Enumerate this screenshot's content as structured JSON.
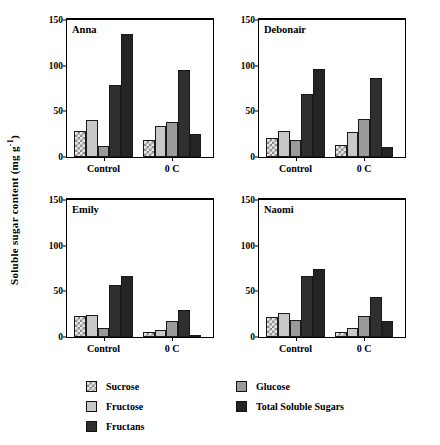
{
  "figure": {
    "ylabel_text": "Soluble sugar content  (mg g",
    "ylabel_sup": "-1",
    "ylabel_tail": ")",
    "ylabel_full": "Soluble sugar content (mg g-1)"
  },
  "legend": {
    "columns": [
      {
        "items": [
          {
            "label": "Sucrose",
            "key": "sucrose",
            "swatch": "checkered-swatch",
            "color": "#e8e8e8"
          },
          {
            "label": "Fructose",
            "key": "fructose",
            "swatch": "light-gray-swatch",
            "color": "#c8c8c8"
          },
          {
            "label": "Fructans",
            "key": "fructans",
            "swatch": "dark-swatch",
            "color": "#2f2f2f"
          }
        ]
      },
      {
        "items": [
          {
            "label": "Glucose",
            "key": "glucose",
            "swatch": "medium-gray-swatch",
            "color": "#9a9a9a"
          },
          {
            "label": "Total Soluble Sugars",
            "key": "total",
            "swatch": "darkest-swatch",
            "color": "#242424"
          }
        ]
      }
    ]
  },
  "chart_data": {
    "type": "bar",
    "title": "",
    "xlabel": "",
    "ylabel": "Soluble sugar content (mg g-1)",
    "ylim": [
      0,
      150
    ],
    "yticks": [
      0,
      50,
      100,
      150
    ],
    "grid": false,
    "legend_position": "bottom",
    "categories": [
      "Control",
      "0 C"
    ],
    "series_names": [
      "Sucrose",
      "Fructose",
      "Glucose",
      "Fructans",
      "Total Soluble Sugars"
    ],
    "panels": [
      {
        "name": "Anna",
        "groups": [
          {
            "category": "Control",
            "values": [
              28,
              40,
              12,
              79,
              135
            ]
          },
          {
            "category": "0 C",
            "values": [
              19,
              34,
              38,
              95,
              25
            ]
          }
        ]
      },
      {
        "name": "Debonair",
        "groups": [
          {
            "category": "Control",
            "values": [
              21,
              28,
              19,
              69,
              96
            ]
          },
          {
            "category": "0 C",
            "values": [
              13,
              27,
              42,
              87,
              11
            ]
          }
        ]
      },
      {
        "name": "Emily",
        "groups": [
          {
            "category": "Control",
            "values": [
              23,
              24,
              10,
              57,
              67
            ]
          },
          {
            "category": "0 C",
            "values": [
              6,
              8,
              18,
              30,
              2
            ]
          }
        ]
      },
      {
        "name": "Naomi",
        "groups": [
          {
            "category": "Control",
            "values": [
              22,
              26,
              19,
              67,
              75
            ]
          },
          {
            "category": "0 C",
            "values": [
              5,
              10,
              23,
              44,
              18
            ]
          }
        ]
      }
    ]
  }
}
